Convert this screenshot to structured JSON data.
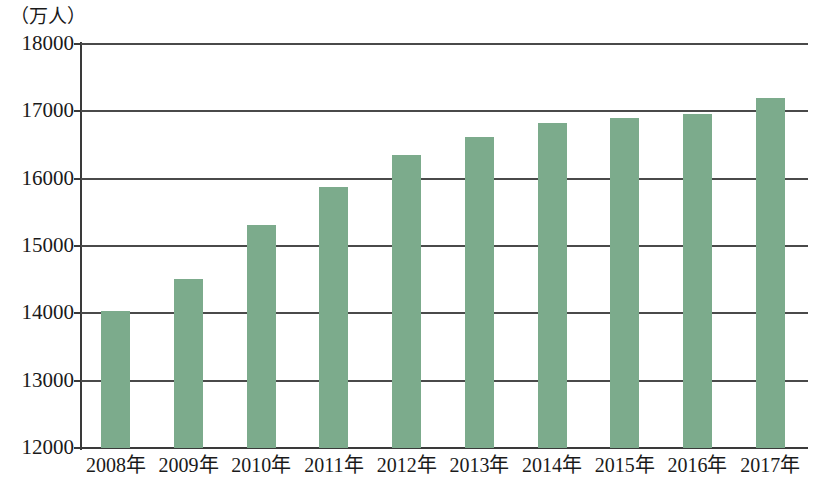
{
  "chart_data": {
    "type": "bar",
    "title": "",
    "subtitle": "",
    "xlabel": "",
    "ylabel": "（万人）",
    "unit_label": "（万人）",
    "categories": [
      "2008年",
      "2009年",
      "2010年",
      "2011年",
      "2012年",
      "2013年",
      "2014年",
      "2015年",
      "2016年",
      "2017年"
    ],
    "values": [
      14030,
      14510,
      15310,
      15870,
      16350,
      16620,
      16820,
      16900,
      16960,
      17200
    ],
    "series": [
      {
        "name": "",
        "values": [
          14030,
          14510,
          15310,
          15870,
          16350,
          16620,
          16820,
          16900,
          16960,
          17200
        ]
      }
    ],
    "ylim": [
      12000,
      18000
    ],
    "ytick_labels": [
      "12000",
      "13000",
      "14000",
      "15000",
      "16000",
      "17000",
      "18000"
    ],
    "ytick_values": [
      12000,
      13000,
      14000,
      15000,
      16000,
      17000,
      18000
    ],
    "grid": true,
    "grid_axis": "y",
    "legend": false,
    "legend_position": "none",
    "bar_color": "#7cab8c",
    "axis_color": "#3a3a3a",
    "background_color": "#ffffff"
  }
}
